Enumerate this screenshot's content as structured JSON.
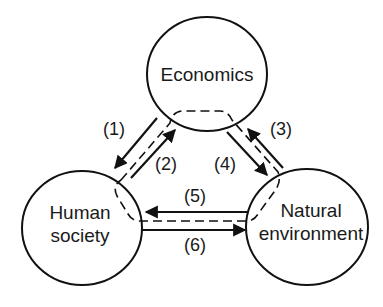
{
  "diagram": {
    "type": "flow-cycle",
    "nodes": [
      {
        "id": "economics",
        "label_lines": [
          "Economics"
        ]
      },
      {
        "id": "human_society",
        "label_lines": [
          "Human",
          "society"
        ]
      },
      {
        "id": "natural_environment",
        "label_lines": [
          "Natural",
          "environment"
        ]
      }
    ],
    "edges": [
      {
        "id": "1",
        "label": "(1)",
        "from": "economics",
        "to": "human_society"
      },
      {
        "id": "2",
        "label": "(2)",
        "from": "human_society",
        "to": "economics"
      },
      {
        "id": "3",
        "label": "(3)",
        "from": "natural_environment",
        "to": "economics"
      },
      {
        "id": "4",
        "label": "(4)",
        "from": "economics",
        "to": "natural_environment"
      },
      {
        "id": "5",
        "label": "(5)",
        "from": "natural_environment",
        "to": "human_society"
      },
      {
        "id": "6",
        "label": "(6)",
        "from": "human_society",
        "to": "natural_environment"
      }
    ],
    "dashed_boundary": "closed dashed loop linking all three nodes between paired arrows",
    "colors": {
      "stroke": "#111111",
      "text": "#1a1a1a",
      "background": "#ffffff"
    }
  }
}
